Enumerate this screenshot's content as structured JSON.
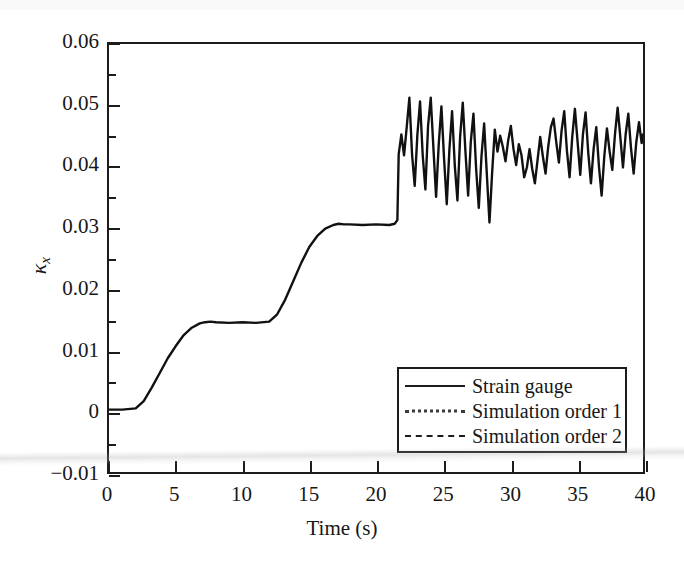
{
  "chart_data": {
    "type": "line",
    "title": "",
    "xlabel": "Time (s)",
    "ylabel": "κ",
    "ylabel_sub": "x",
    "xlim": [
      0,
      40
    ],
    "ylim": [
      -0.01,
      0.06
    ],
    "xticks": [
      "0",
      "5",
      "10",
      "15",
      "20",
      "25",
      "30",
      "35",
      "40"
    ],
    "xtick_values": [
      0,
      5,
      10,
      15,
      20,
      25,
      30,
      35,
      40
    ],
    "yticks": [
      "-0.01",
      "0",
      "0.01",
      "0.02",
      "0.03",
      "0.04",
      "0.05",
      "0.06"
    ],
    "ytick_values": [
      -0.01,
      0,
      0.01,
      0.02,
      0.03,
      0.04,
      0.05,
      0.06
    ],
    "yminor_values": [
      -0.005,
      0.005,
      0.015,
      0.025,
      0.035,
      0.045,
      0.055
    ],
    "grid": false,
    "legend_position": "lower right",
    "legend": [
      {
        "label": "Strain gauge",
        "style": "solid"
      },
      {
        "label": "Simulation order 1",
        "style": "dotted"
      },
      {
        "label": "Simulation order 2",
        "style": "dashed"
      }
    ],
    "series": [
      {
        "name": "Strain gauge",
        "style": "solid",
        "x": [
          0.0,
          1.0,
          2.0,
          2.6,
          3.2,
          3.8,
          4.4,
          5.0,
          5.6,
          6.2,
          6.8,
          7.2,
          7.6,
          8.0,
          9.0,
          10.0,
          11.0,
          12.0,
          12.6,
          13.2,
          13.8,
          14.4,
          15.0,
          15.6,
          16.2,
          16.8,
          17.2,
          17.6,
          18.0,
          19.0,
          20.0,
          21.0,
          21.4,
          21.6,
          21.7,
          21.9,
          22.1,
          22.3,
          22.5,
          22.7,
          22.9,
          23.1,
          23.3,
          23.5,
          23.7,
          23.9,
          24.1,
          24.3,
          24.5,
          24.7,
          24.9,
          25.1,
          25.3,
          25.5,
          25.7,
          25.9,
          26.1,
          26.3,
          26.5,
          26.7,
          26.9,
          27.1,
          27.3,
          27.5,
          27.7,
          27.9,
          28.1,
          28.3,
          28.5,
          28.7,
          28.9,
          29.1,
          29.3,
          29.5,
          29.7,
          29.9,
          30.1,
          30.3,
          30.5,
          30.7,
          30.9,
          31.1,
          31.3,
          31.5,
          31.7,
          31.9,
          32.1,
          32.3,
          32.5,
          32.7,
          32.9,
          33.1,
          33.3,
          33.5,
          33.7,
          33.9,
          34.1,
          34.3,
          34.5,
          34.7,
          34.9,
          35.1,
          35.3,
          35.5,
          35.7,
          35.9,
          36.1,
          36.3,
          36.5,
          36.7,
          36.9,
          37.1,
          37.3,
          37.5,
          37.7,
          37.9,
          38.1,
          38.3,
          38.5,
          38.7,
          38.9,
          39.1,
          39.3,
          39.5,
          39.7,
          39.9,
          40.0
        ],
        "y": [
          0.0002,
          0.0002,
          0.0004,
          0.0016,
          0.0038,
          0.0062,
          0.0086,
          0.0106,
          0.0124,
          0.0136,
          0.0143,
          0.0145,
          0.0146,
          0.0145,
          0.0144,
          0.0145,
          0.0144,
          0.0146,
          0.0158,
          0.0182,
          0.0212,
          0.0242,
          0.0268,
          0.0286,
          0.0298,
          0.0304,
          0.0306,
          0.0305,
          0.0305,
          0.0304,
          0.0305,
          0.0304,
          0.0306,
          0.0312,
          0.042,
          0.0452,
          0.0418,
          0.0464,
          0.0512,
          0.042,
          0.0368,
          0.0452,
          0.0506,
          0.0418,
          0.0362,
          0.0466,
          0.0512,
          0.043,
          0.035,
          0.0436,
          0.0498,
          0.0412,
          0.0338,
          0.0428,
          0.049,
          0.0402,
          0.0344,
          0.0448,
          0.0504,
          0.0424,
          0.0352,
          0.044,
          0.0486,
          0.0396,
          0.0332,
          0.0416,
          0.047,
          0.0388,
          0.0308,
          0.039,
          0.046,
          0.0424,
          0.045,
          0.0432,
          0.0408,
          0.0442,
          0.0466,
          0.0428,
          0.0402,
          0.0436,
          0.0418,
          0.0382,
          0.0398,
          0.0428,
          0.0396,
          0.0372,
          0.041,
          0.0448,
          0.0416,
          0.0388,
          0.0432,
          0.0464,
          0.0478,
          0.044,
          0.0406,
          0.0458,
          0.049,
          0.0426,
          0.0382,
          0.0448,
          0.0494,
          0.044,
          0.0386,
          0.0452,
          0.0488,
          0.0422,
          0.0372,
          0.0428,
          0.0464,
          0.04,
          0.0352,
          0.0416,
          0.0462,
          0.0424,
          0.0394,
          0.0452,
          0.0496,
          0.0448,
          0.0398,
          0.0452,
          0.0486,
          0.043,
          0.0388,
          0.044,
          0.0472,
          0.0438,
          0.0452
        ]
      }
    ]
  }
}
